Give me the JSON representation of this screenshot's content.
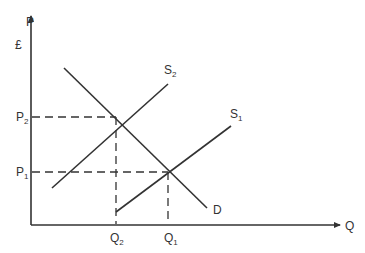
{
  "diagram": {
    "type": "supply-demand",
    "axes": {
      "y_label": "P",
      "y_unit": "£",
      "x_label": "Q"
    },
    "curves": {
      "demand": {
        "label": "D"
      },
      "supply_1": {
        "label": "S",
        "sub": "1"
      },
      "supply_2": {
        "label": "S",
        "sub": "2"
      }
    },
    "price_levels": [
      {
        "label": "P",
        "sub": "2"
      },
      {
        "label": "P",
        "sub": "1"
      }
    ],
    "quantity_levels": [
      {
        "label": "Q",
        "sub": "2"
      },
      {
        "label": "Q",
        "sub": "1"
      }
    ],
    "colors": {
      "line": "#333333",
      "background": "#ffffff"
    }
  }
}
